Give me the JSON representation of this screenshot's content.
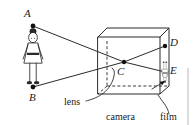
{
  "figure": {
    "background_color": "#ffffff",
    "ink_color": "#2b2b2b",
    "width": 195,
    "height": 125
  },
  "point_labels": {
    "a": "A",
    "b": "B",
    "c": "C",
    "d": "D",
    "e": "E"
  },
  "part_labels": {
    "lens": "lens",
    "camera": "camera",
    "film": "film"
  },
  "objects": {
    "subject_name": "standing-person",
    "image_name": "inverted-person-image"
  }
}
